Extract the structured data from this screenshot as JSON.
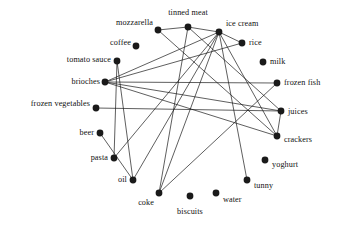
{
  "diagram": {
    "type": "node-link-graph",
    "title": "",
    "style": {
      "node_color": "#1a1a1a",
      "edge_color": "#1a1a1a",
      "background": "#ffffff",
      "node_radius": 3.4,
      "edge_width": 0.7
    },
    "nodes": [
      {
        "id": "mozzarella",
        "label": "mozzarella",
        "x": 158,
        "y": 30,
        "label_x": 153,
        "label_y": 23,
        "anchor": "end"
      },
      {
        "id": "tinned_meat",
        "label": "tinned meat",
        "x": 188,
        "y": 27,
        "label_x": 188,
        "label_y": 13,
        "anchor": "middle"
      },
      {
        "id": "ice_cream",
        "label": "ice cream",
        "x": 219,
        "y": 32,
        "label_x": 226,
        "label_y": 24,
        "anchor": "start"
      },
      {
        "id": "rice",
        "label": "rice",
        "x": 242,
        "y": 43,
        "label_x": 249,
        "label_y": 43,
        "anchor": "start"
      },
      {
        "id": "coffee",
        "label": "coffee",
        "x": 136,
        "y": 46,
        "label_x": 131,
        "label_y": 43,
        "anchor": "end"
      },
      {
        "id": "milk",
        "label": "milk",
        "x": 263,
        "y": 62,
        "label_x": 270,
        "label_y": 62,
        "anchor": "start"
      },
      {
        "id": "tomato_sauce",
        "label": "tomato sauce",
        "x": 117,
        "y": 61,
        "label_x": 111,
        "label_y": 60,
        "anchor": "end"
      },
      {
        "id": "brioches",
        "label": "brioches",
        "x": 105,
        "y": 82,
        "label_x": 100,
        "label_y": 82,
        "anchor": "end"
      },
      {
        "id": "frozen_fish",
        "label": "frozen fish",
        "x": 277,
        "y": 83,
        "label_x": 284,
        "label_y": 83,
        "anchor": "start"
      },
      {
        "id": "frozen_vegetables",
        "label": "frozen vegetables",
        "x": 96,
        "y": 108,
        "label_x": 90,
        "label_y": 104,
        "anchor": "end"
      },
      {
        "id": "juices",
        "label": "juices",
        "x": 281,
        "y": 111,
        "label_x": 288,
        "label_y": 112,
        "anchor": "start"
      },
      {
        "id": "beer",
        "label": "beer",
        "x": 100,
        "y": 133,
        "label_x": 94,
        "label_y": 133,
        "anchor": "end"
      },
      {
        "id": "crackers",
        "label": "crackers",
        "x": 277,
        "y": 136,
        "label_x": 284,
        "label_y": 140,
        "anchor": "start"
      },
      {
        "id": "pasta",
        "label": "pasta",
        "x": 114,
        "y": 158,
        "label_x": 108,
        "label_y": 158,
        "anchor": "end"
      },
      {
        "id": "yoghurt",
        "label": "yoghurt",
        "x": 265,
        "y": 160,
        "label_x": 272,
        "label_y": 165,
        "anchor": "start"
      },
      {
        "id": "oil",
        "label": "oil",
        "x": 133,
        "y": 180,
        "label_x": 127,
        "label_y": 180,
        "anchor": "end"
      },
      {
        "id": "tunny",
        "label": "tunny",
        "x": 247,
        "y": 180,
        "label_x": 254,
        "label_y": 186,
        "anchor": "start"
      },
      {
        "id": "coke",
        "label": "coke",
        "x": 159,
        "y": 193,
        "label_x": 154,
        "label_y": 203,
        "anchor": "end"
      },
      {
        "id": "biscuits",
        "label": "biscuits",
        "x": 190,
        "y": 196,
        "label_x": 190,
        "label_y": 212,
        "anchor": "middle"
      },
      {
        "id": "water",
        "label": "water",
        "x": 216,
        "y": 193,
        "label_x": 223,
        "label_y": 200,
        "anchor": "start"
      }
    ],
    "edges": [
      {
        "source": "mozzarella",
        "target": "tinned_meat"
      },
      {
        "source": "mozzarella",
        "target": "crackers"
      },
      {
        "source": "tinned_meat",
        "target": "ice_cream"
      },
      {
        "source": "tinned_meat",
        "target": "juices"
      },
      {
        "source": "tinned_meat",
        "target": "coke"
      },
      {
        "source": "ice_cream",
        "target": "rice"
      },
      {
        "source": "ice_cream",
        "target": "brioches"
      },
      {
        "source": "ice_cream",
        "target": "pasta"
      },
      {
        "source": "ice_cream",
        "target": "oil"
      },
      {
        "source": "ice_cream",
        "target": "coke"
      },
      {
        "source": "ice_cream",
        "target": "tunny"
      },
      {
        "source": "ice_cream",
        "target": "crackers"
      },
      {
        "source": "rice",
        "target": "brioches"
      },
      {
        "source": "tomato_sauce",
        "target": "pasta"
      },
      {
        "source": "tomato_sauce",
        "target": "oil"
      },
      {
        "source": "brioches",
        "target": "frozen_fish"
      },
      {
        "source": "brioches",
        "target": "juices"
      },
      {
        "source": "brioches",
        "target": "crackers"
      },
      {
        "source": "frozen_vegetables",
        "target": "juices"
      },
      {
        "source": "frozen_fish",
        "target": "coke"
      },
      {
        "source": "juices",
        "target": "crackers"
      },
      {
        "source": "beer",
        "target": "oil"
      }
    ]
  }
}
